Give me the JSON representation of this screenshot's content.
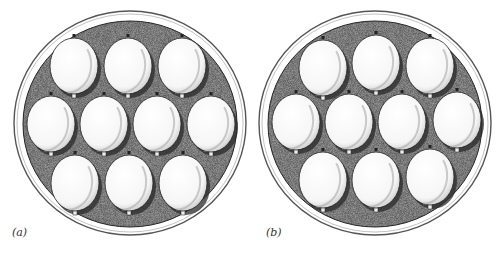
{
  "figure": {
    "panels": [
      {
        "id": "a",
        "label": "(a)",
        "label_pos": [
          12,
          237
        ],
        "outer": {
          "cx": 130,
          "cy": 123,
          "rx": 116,
          "ry": 112
        },
        "inner": {
          "cx": 130,
          "cy": 124,
          "rx": 107,
          "ry": 103
        },
        "eggs": [
          {
            "cx": 74,
            "cy": 66
          },
          {
            "cx": 128,
            "cy": 66
          },
          {
            "cx": 182,
            "cy": 66
          },
          {
            "cx": 51,
            "cy": 124
          },
          {
            "cx": 104,
            "cy": 124
          },
          {
            "cx": 157,
            "cy": 124
          },
          {
            "cx": 211,
            "cy": 124
          },
          {
            "cx": 75,
            "cy": 183
          },
          {
            "cx": 129,
            "cy": 183
          },
          {
            "cx": 183,
            "cy": 183
          }
        ]
      },
      {
        "id": "b",
        "label": "(b)",
        "label_pos": [
          266,
          237
        ],
        "outer": {
          "cx": 375,
          "cy": 123,
          "rx": 116,
          "ry": 112
        },
        "inner": {
          "cx": 375,
          "cy": 124,
          "rx": 107,
          "ry": 103
        },
        "eggs": [
          {
            "cx": 323,
            "cy": 68
          },
          {
            "cx": 376,
            "cy": 63
          },
          {
            "cx": 430,
            "cy": 66
          },
          {
            "cx": 296,
            "cy": 122
          },
          {
            "cx": 349,
            "cy": 122
          },
          {
            "cx": 402,
            "cy": 122
          },
          {
            "cx": 457,
            "cy": 120
          },
          {
            "cx": 323,
            "cy": 180
          },
          {
            "cx": 376,
            "cy": 180
          },
          {
            "cx": 430,
            "cy": 177
          }
        ]
      }
    ],
    "egg_size": {
      "rx": 24,
      "ry": 28
    },
    "colors": {
      "ring": "#555555",
      "tray": "#8a8a8a",
      "egg": "#fbfbfb",
      "egg_shade": "#c9c9c9",
      "ink": "#222222"
    }
  }
}
